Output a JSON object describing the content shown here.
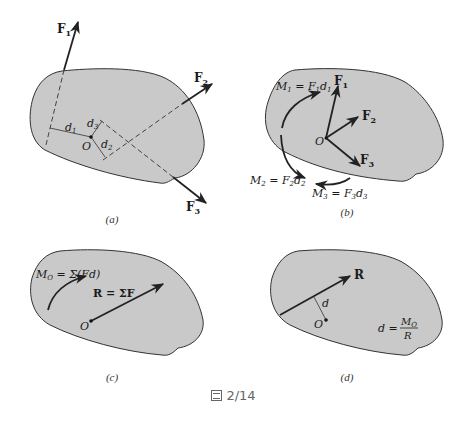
{
  "figure": {
    "label": "2/14",
    "icon": "figure-icon",
    "colors": {
      "body_fill": "#c9c9c9",
      "outline": "#333333",
      "arrow": "#222222",
      "background": "#ffffff"
    }
  },
  "panels": [
    {
      "id": "a",
      "caption": "(a)",
      "labels": {
        "F1": "F",
        "F1_sub": "1",
        "F2": "F",
        "F2_sub": "2",
        "F3": "F",
        "F3_sub": "3",
        "d1": "d",
        "d1_sub": "1",
        "d2": "d",
        "d2_sub": "2",
        "d3": "d",
        "d3_sub": "3",
        "O": "O"
      }
    },
    {
      "id": "b",
      "caption": "(b)",
      "labels": {
        "M1": "M",
        "M1_sub": "1",
        "M1_eq": " = F",
        "M1_eq_sub": "1",
        "M1_d": "d",
        "M1_d_sub": "1",
        "M2": "M",
        "M2_sub": "2",
        "M2_eq": " = F",
        "M2_eq_sub": "2",
        "M2_d": "d",
        "M2_d_sub": "2",
        "M3": "M",
        "M3_sub": "3",
        "M3_eq": " = F",
        "M3_eq_sub": "3",
        "M3_d": "d",
        "M3_d_sub": "3",
        "F1": "F",
        "F1_sub": "1",
        "F2": "F",
        "F2_sub": "2",
        "F3": "F",
        "F3_sub": "3",
        "O": "O"
      }
    },
    {
      "id": "c",
      "caption": "(c)",
      "labels": {
        "MO": "M",
        "MO_sub": "O",
        "MO_eq": " = Σ(Fd)",
        "R_eq": "R = ΣF",
        "O": "O"
      }
    },
    {
      "id": "d",
      "caption": "(d)",
      "labels": {
        "R": "R",
        "d": "d",
        "O": "O",
        "formula_lhs": "d =",
        "formula_num": "M",
        "formula_num_sub": "O",
        "formula_den": "R"
      }
    }
  ]
}
